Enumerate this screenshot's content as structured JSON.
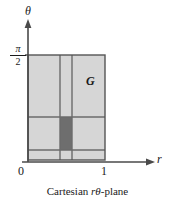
{
  "figure": {
    "caption_prefix": "Cartesian ",
    "caption_vars": "rθ",
    "caption_suffix": "-plane",
    "region_label": "G",
    "axes": {
      "vertical_label": "θ",
      "horizontal_label": "r",
      "origin_label": "0",
      "x_tick_label": "1",
      "y_tick_numerator": "π",
      "y_tick_denominator": "2"
    },
    "colors": {
      "region_fill": "#d6d6d6",
      "highlight_fill": "#6e6e6e",
      "grid_line": "#6b6b6b",
      "border_line": "#555555",
      "axis_line": "#4a4a4a",
      "text": "#1a1a1a",
      "background": "#ffffff"
    },
    "geometry": {
      "region_x0": 28,
      "region_y0": 55,
      "region_x1": 105,
      "region_y1": 160,
      "vertical_grid_x": [
        60,
        72
      ],
      "horizontal_grid_y": [
        117,
        150
      ],
      "highlight_cell": {
        "x": 60,
        "y": 117,
        "w": 12,
        "h": 33
      },
      "axis_x": 28,
      "axis_y": 162,
      "axis_top": 22,
      "axis_right": 152,
      "tick_pi_over_two_y": 55,
      "tick_one_x": 105
    }
  }
}
